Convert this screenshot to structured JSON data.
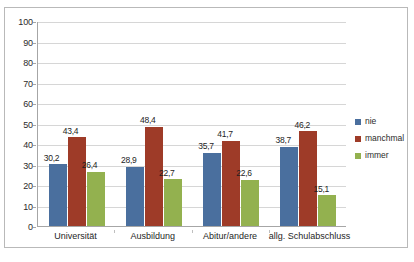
{
  "chart_data": {
    "type": "bar",
    "title": "",
    "subtitle": "",
    "xlabel": "",
    "ylabel": "",
    "ylim": [
      0,
      100
    ],
    "ytick_step": 10,
    "yticks": [
      "100",
      "90",
      "80",
      "70",
      "60",
      "50",
      "40",
      "30",
      "20",
      "10",
      "0"
    ],
    "grid": true,
    "legend_position": "right",
    "decimal_separator": ",",
    "categories": [
      "Universität",
      "Ausbildung",
      "Abitur/andere",
      "allg. Schulabschluss"
    ],
    "series": [
      {
        "name": "nie",
        "color": "#4a6f9e",
        "values": [
          30.2,
          28.9,
          35.7,
          38.7
        ],
        "labels": [
          "30,2",
          "28,9",
          "35,7",
          "38,7"
        ]
      },
      {
        "name": "manchmal",
        "color": "#9e3b28",
        "values": [
          43.4,
          48.4,
          41.7,
          46.2
        ],
        "labels": [
          "43,4",
          "48,4",
          "41,7",
          "46,2"
        ]
      },
      {
        "name": "immer",
        "color": "#93b14f",
        "values": [
          26.4,
          22.7,
          22.6,
          15.1
        ],
        "labels": [
          "26,4",
          "22,7",
          "22,6",
          "15,1"
        ]
      }
    ]
  },
  "colors": {
    "series_nie": "#4a6f9e",
    "series_manchmal": "#9e3b28",
    "series_immer": "#93b14f",
    "gridline": "#d6d6d6",
    "axis": "#a6a6a6",
    "frame_border": "#b9b9b9",
    "background": "#ffffff",
    "text": "#1e1e1e"
  }
}
